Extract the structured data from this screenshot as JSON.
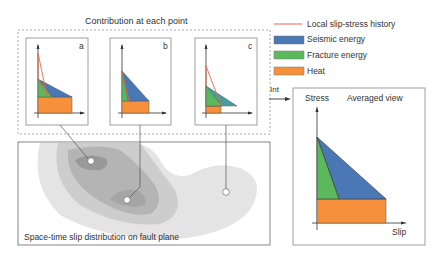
{
  "top_title": "Contribution at each point",
  "panels": [
    {
      "label": "a"
    },
    {
      "label": "b"
    },
    {
      "label": "c"
    }
  ],
  "legend": {
    "items": [
      {
        "label": "Local slip-stress history",
        "color": "#e8694a",
        "type": "line"
      },
      {
        "label": "Seismic energy",
        "color": "#4a78b5",
        "type": "box"
      },
      {
        "label": "Fracture energy",
        "color": "#5cb85c",
        "type": "box"
      },
      {
        "label": "Heat",
        "color": "#f7903a",
        "type": "box"
      }
    ]
  },
  "arrow_label": "Int",
  "averaged": {
    "y_axis_label": "Stress",
    "title": "Averaged view",
    "x_axis_label": "Slip"
  },
  "fault_plane_caption": "Space-time slip distribution on fault plane",
  "colors": {
    "seismic": "#4a78b5",
    "fracture": "#5cb85c",
    "heat": "#f7903a",
    "history": "#e8694a",
    "frame": "#777777"
  }
}
